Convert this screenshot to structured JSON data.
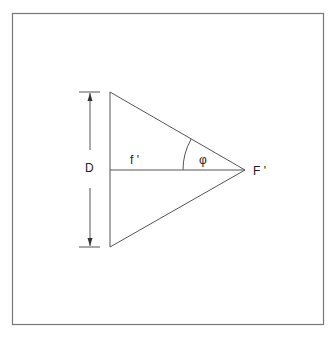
{
  "diagram": {
    "type": "optics-aperture-angle",
    "labels": {
      "diameter": "D",
      "focal_length": "f '",
      "angle": "φ",
      "focal_point": "F '"
    },
    "colors": {
      "stroke": "#555555",
      "frame": "#777777",
      "text": "#222222",
      "background": "#ffffff"
    }
  }
}
